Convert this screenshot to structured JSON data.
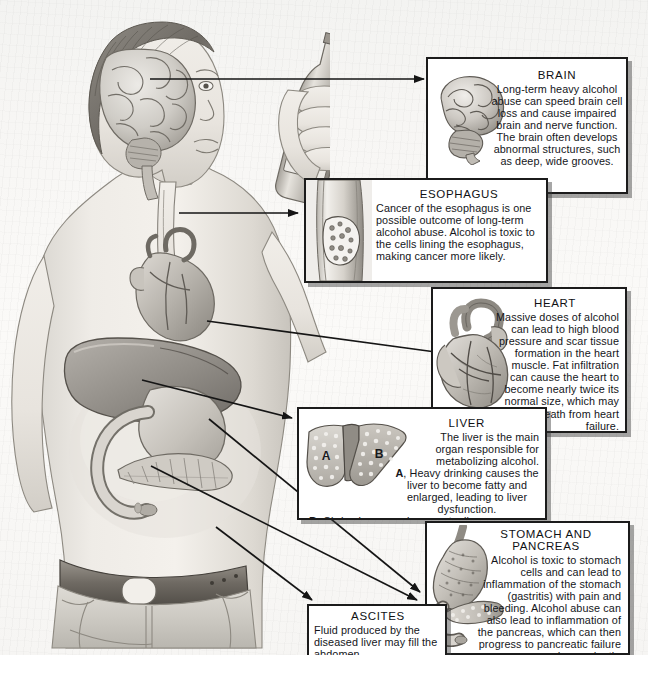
{
  "document": {
    "title": "Effects of Alcohol on the Body",
    "type": "medical-illustration-diagram",
    "background_color": "#f7f6f4",
    "panel_border_color": "#1b1b1b",
    "panel_background_color": "#ffffff",
    "text_color": "#14161a"
  },
  "figure": {
    "label": "human-torso-illustration",
    "bottle_label_line1": "PREMIUM",
    "bottle_label_line2": "LAGER",
    "organs": [
      {
        "name": "brain",
        "hotspot": "brain-hotspot"
      },
      {
        "name": "esophagus",
        "hotspot": "esophagus-hotspot"
      },
      {
        "name": "heart",
        "hotspot": "heart-hotspot"
      },
      {
        "name": "liver",
        "hotspot": "liver-hotspot"
      },
      {
        "name": "stomach",
        "hotspot": "stomach-hotspot"
      },
      {
        "name": "pancreas",
        "hotspot": "pancreas-hotspot"
      },
      {
        "name": "abdomen",
        "hotspot": "abdomen-hotspot"
      }
    ]
  },
  "panels": {
    "brain": {
      "title": "BRAIN",
      "body": "Long-term heavy alcohol abuse can speed brain cell loss and cause impaired brain and nerve function. The brain often develops abnormal structures, such as deep, wide grooves.",
      "art": "brain-illustration"
    },
    "esophagus": {
      "title": "ESOPHAGUS",
      "body": "Cancer of the esophagus is one possible outcome of long-term alcohol abuse. Alcohol is toxic to the cells lining the esophagus, making cancer more likely.",
      "art": "esophagus-illustration"
    },
    "heart": {
      "title": "HEART",
      "body": "Massive doses of alcohol can lead to high blood pressure and scar tissue formation in the heart muscle. Fat infiltration can cause the heart to become nearly twice its normal size, which may lead to death from heart failure.",
      "art": "heart-illustration"
    },
    "liver": {
      "title": "LIVER",
      "body_1": "The liver is the main organ responsible for metabolizing alcohol.",
      "marker_a": "A",
      "body_2": ", Heavy drinking causes the liver to become fatty and enlarged, leading to liver dysfunction.",
      "marker_b": "B",
      "body_3": ", Cirrhosis or scarring eventually appears, which can lead to liver failure and death.",
      "art": "liver-illustration",
      "art_label_a": "A",
      "art_label_b": "B"
    },
    "stomach": {
      "title_line1": "STOMACH AND",
      "title_line2": "PANCREAS",
      "body": "Alcohol is toxic to stomach cells and can lead to inflammation of the stomach (gastritis) with pain and bleeding. Alcohol abuse can also lead to inflammation of the pancreas, which can then progress to pancreatic failure and even death.",
      "art": "stomach-pancreas-illustration"
    },
    "ascites": {
      "title": "ASCITES",
      "body": "Fluid produced by the diseased liver may fill the abdomen.",
      "art": null
    }
  },
  "connectors": [
    {
      "from": "brain-hotspot",
      "to": "brain-panel"
    },
    {
      "from": "esophagus-hotspot",
      "to": "esophagus-panel"
    },
    {
      "from": "heart-hotspot",
      "to": "heart-panel"
    },
    {
      "from": "liver-hotspot",
      "to": "liver-panel"
    },
    {
      "from": "stomach-hotspot",
      "to": "stomach-panel"
    },
    {
      "from": "pancreas-hotspot",
      "to": "stomach-panel"
    },
    {
      "from": "abdomen-hotspot",
      "to": "ascites-panel"
    }
  ]
}
